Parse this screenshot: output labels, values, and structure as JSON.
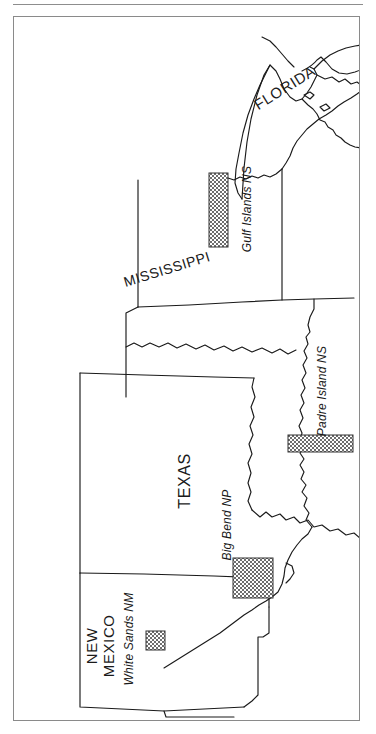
{
  "page": {
    "background_color": "#ffffff",
    "rule_color": "#8d8d8d",
    "frame_color": "#8a8a8a",
    "outline_color": "#1a1a1a",
    "park_fill_color": "#8c8c8c"
  },
  "map": {
    "orientation_note": "map is rotated 90 degrees clockwise",
    "states": [
      {
        "id": "florida",
        "label": "FLORIDA",
        "rotation_deg": -32,
        "font_size_px": 15,
        "x_px": 276,
        "y_px": 77
      },
      {
        "id": "mississippi",
        "label": "MISSISSIPPI",
        "rotation_deg": -17,
        "font_size_px": 14,
        "x_px": 164,
        "y_px": 267
      },
      {
        "id": "texas",
        "label": "TEXAS",
        "rotation_deg": -90,
        "font_size_px": 16,
        "x_px": 181,
        "y_px": 479
      },
      {
        "id": "new-mexico",
        "label": "NEW\nMEXICO",
        "line_1": "NEW",
        "line_2": "MEXICO",
        "rotation_deg": -90,
        "font_size_px": 15,
        "x_px": 92,
        "y_px": 645
      }
    ],
    "parks": [
      {
        "id": "gulf-islands-ns",
        "label": "Gulf Islands NS",
        "rotation_deg": -90,
        "font_size_px": 12,
        "label_x_px": 243,
        "label_y_px": 208,
        "marker": {
          "x_px": 208,
          "y_px": 172,
          "width_px": 19,
          "height_px": 74,
          "shape": "rectangle"
        }
      },
      {
        "id": "padre-island-ns",
        "label": "Padre Island NS",
        "rotation_deg": -90,
        "font_size_px": 12,
        "label_x_px": 318,
        "label_y_px": 390,
        "marker": {
          "x_px": 287,
          "y_px": 434,
          "width_px": 65,
          "height_px": 17,
          "shape": "rectangle"
        }
      },
      {
        "id": "big-bend-np",
        "label": "Big Bend NP",
        "rotation_deg": -90,
        "font_size_px": 12,
        "label_x_px": 224,
        "label_y_px": 523,
        "marker": {
          "x_px": 232,
          "y_px": 557,
          "width_px": 40,
          "height_px": 40,
          "shape": "rectangle"
        }
      },
      {
        "id": "white-sands-nm",
        "label": "White Sands NM",
        "rotation_deg": -90,
        "font_size_px": 12,
        "label_x_px": 122,
        "label_y_px": 639,
        "marker": {
          "x_px": 145,
          "y_px": 630,
          "width_px": 19,
          "height_px": 19,
          "shape": "rectangle"
        }
      }
    ]
  }
}
